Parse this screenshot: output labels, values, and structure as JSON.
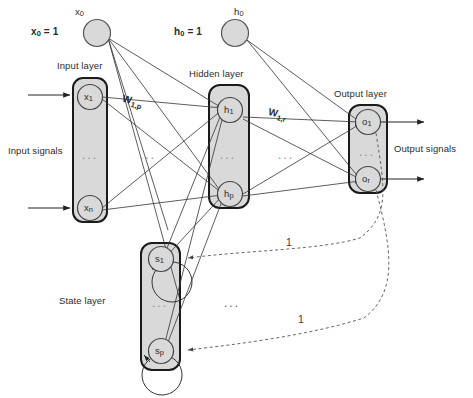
{
  "diagram": {
    "type": "neural-network-diagram",
    "colors": {
      "box_fill": "#d9d9d9",
      "box_stroke": "#1a1a1a",
      "node_fill": "#d9d9d9",
      "node_stroke": "#444444",
      "connection": "#333333",
      "feedback_dashed": "#555555",
      "text": "#2b2b2b",
      "background": "#ffffff"
    },
    "layers": [
      {
        "id": "input",
        "label": "Input layer",
        "nodes": [
          {
            "id": "x1",
            "label": "x",
            "sub": "1"
          },
          {
            "id": "xn",
            "label": "x",
            "sub": "n"
          }
        ],
        "ellipsis": "..."
      },
      {
        "id": "hidden",
        "label": "Hidden layer",
        "nodes": [
          {
            "id": "h1",
            "label": "h",
            "sub": "1"
          },
          {
            "id": "hp",
            "label": "h",
            "sub": "p"
          }
        ],
        "ellipsis": "..."
      },
      {
        "id": "output",
        "label": "Output layer",
        "nodes": [
          {
            "id": "o1",
            "label": "o",
            "sub": "1"
          },
          {
            "id": "or",
            "label": "o",
            "sub": "r"
          }
        ],
        "ellipsis": "..."
      },
      {
        "id": "state",
        "label": "State layer",
        "nodes": [
          {
            "id": "s1",
            "label": "s",
            "sub": "1"
          },
          {
            "id": "sp",
            "label": "s",
            "sub": "p"
          }
        ],
        "ellipsis": "..."
      }
    ],
    "bias_nodes": [
      {
        "id": "x0",
        "node_label": "x",
        "node_sub": "0",
        "equation": "x",
        "equation_sub": "0",
        "equation_value": "= 1"
      },
      {
        "id": "h0",
        "node_label": "h",
        "node_sub": "0",
        "equation": "h",
        "equation_sub": "0",
        "equation_value": "= 1"
      }
    ],
    "weight_labels": [
      {
        "id": "w1p",
        "base": "W",
        "sub": "1,p"
      },
      {
        "id": "w1r",
        "base": "W",
        "sub": "1,r"
      }
    ],
    "signal_labels": {
      "input": "Input signals",
      "output": "Output signals"
    },
    "feedback_labels": [
      {
        "id": "fb-top",
        "text": "1"
      },
      {
        "id": "fb-bottom",
        "text": "1"
      }
    ],
    "mid_ellipsis": [
      {
        "id": "input-hidden-gap",
        "text": "..."
      },
      {
        "id": "hidden-output-gap",
        "text": "..."
      },
      {
        "id": "feedback-gap",
        "text": "..."
      }
    ]
  }
}
